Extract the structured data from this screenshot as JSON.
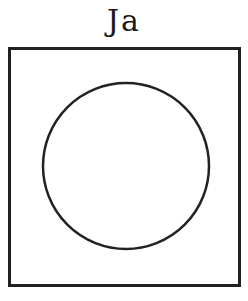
{
  "ballot": {
    "label": "Ja",
    "option_box": {
      "shape": "square",
      "border_color": "#222222"
    },
    "circle": {
      "cx": 126,
      "cy": 166,
      "r": 83,
      "stroke_color": "#222222",
      "filled": false
    }
  }
}
